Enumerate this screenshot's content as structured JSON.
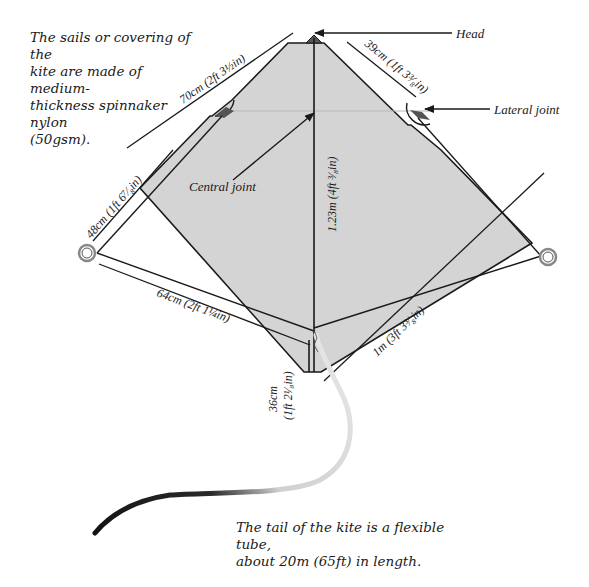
{
  "captions": {
    "sails_line1": "The sails or covering of the",
    "sails_line2": "kite are made of medium-",
    "sails_line3": "thickness spinnaker nylon",
    "sails_line4": "(50gsm).",
    "tail_line1": "The tail of the kite is a flexible tube,",
    "tail_line2": "about 20m (65ft) in length."
  },
  "labels": {
    "head": "Head",
    "lateral_joint": "Lateral joint",
    "central_joint": "Central joint"
  },
  "dimensions": {
    "top_left_edge": "70cm (2ft 3½in)",
    "top_right_edge": "39cm (1ft 3³⁄₈in)",
    "spine": "1.23m (4ft ³⁄₈in)",
    "left_bridle": "48cm (1ft 6⁷⁄₈in)",
    "lower_bridle": "64cm (2ft 1¼in)",
    "bottom_right_edge": "1m (3ft 3³⁄₈in)",
    "tail_segment_line1": "36cm",
    "tail_segment_line2": "(1ft 2¹⁄₈in)"
  },
  "colors": {
    "sail_fill": "#d4d4d4",
    "outline": "#1a1a1a",
    "guide_line": "#b8b8b8",
    "ring": "#888888"
  }
}
